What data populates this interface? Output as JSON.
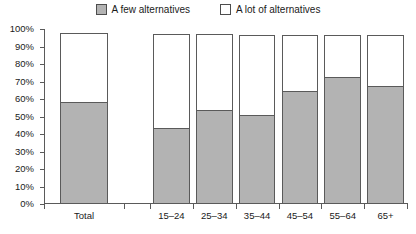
{
  "chart_data": {
    "type": "bar",
    "subtype": "stacked-bar",
    "title": "",
    "subtitle": "",
    "xlabel": "",
    "ylabel": "",
    "ylim": [
      0,
      100
    ],
    "ytick_labels": [
      "100%",
      "90%",
      "80%",
      "70%",
      "60%",
      "50%",
      "40%",
      "30%",
      "20%",
      "10%",
      "0%"
    ],
    "ytick_values": [
      100,
      90,
      80,
      70,
      60,
      50,
      40,
      30,
      20,
      10,
      0
    ],
    "grid": false,
    "legend_position": "top",
    "categories": [
      "Total",
      "15–24",
      "25–34",
      "35–44",
      "45–54",
      "55–64",
      "65+"
    ],
    "series": [
      {
        "name": "A few alternatives",
        "color": "#b3b3b3",
        "values": [
          58,
          43,
          53,
          50.5,
          64,
          72,
          67
        ]
      },
      {
        "name": "A lot of alternatives",
        "color": "#ffffff",
        "values": [
          39.5,
          54,
          44,
          46.5,
          32.5,
          24.5,
          29.5
        ]
      }
    ],
    "bar_totals": [
      97.5,
      97,
      97,
      96.8,
      96.5,
      96.5,
      96.5
    ],
    "group_gap_after_index": 0
  },
  "legend": {
    "entries": [
      {
        "label": "A few alternatives",
        "swatch": "gray-swatch-icon"
      },
      {
        "label": "A lot of alternatives",
        "swatch": "white-swatch-icon"
      }
    ]
  },
  "colors": {
    "series_gray": "#b3b3b3",
    "series_white": "#ffffff",
    "axis": "#5a5a5a",
    "text": "#1a1a1a",
    "background": "#ffffff"
  }
}
